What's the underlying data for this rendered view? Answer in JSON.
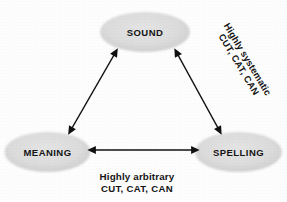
{
  "diagram": {
    "background_color": "#fdfdfd",
    "node_fill_color": "#dcdcdc",
    "text_color": "#141414",
    "arrow_color": "#111111",
    "nodes": [
      {
        "id": "sound",
        "label": "SOUND",
        "cx": 145,
        "cy": 32,
        "rx": 45,
        "ry": 20
      },
      {
        "id": "meaning",
        "label": "MEANING",
        "cx": 47.5,
        "cy": 152,
        "rx": 43,
        "ry": 20
      },
      {
        "id": "spelling",
        "label": "SPELLING",
        "cx": 238.5,
        "cy": 152,
        "rx": 43.5,
        "ry": 20
      }
    ],
    "connectors": [
      {
        "id": "meaning-sound",
        "from": "MEANING",
        "to": "SOUND",
        "style": "double-headed-arrow",
        "label_lines": []
      },
      {
        "id": "sound-spelling",
        "from": "SOUND",
        "to": "SPELLING",
        "style": "double-headed-arrow",
        "label_lines": [
          "Highly systematic",
          "CUT, CAT, CAN"
        ]
      },
      {
        "id": "meaning-spelling",
        "from": "MEANING",
        "to": "SPELLING",
        "style": "double-headed-arrow",
        "label_lines": [
          "Highly arbitrary",
          "CUT, CAT, CAN"
        ]
      }
    ],
    "captions": {
      "bottom": {
        "line1": "Highly arbitrary",
        "line2": "CUT, CAT, CAN"
      },
      "diagonal": {
        "line1": "Highly systematic",
        "line2": "CUT, CAT, CAN",
        "rotation_degrees": 59
      }
    }
  }
}
